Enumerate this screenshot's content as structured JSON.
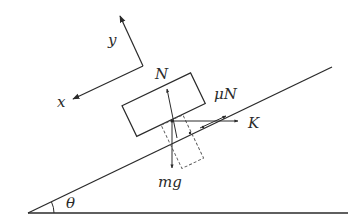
{
  "diagram": {
    "labels": {
      "y_axis": "y",
      "x_axis": "x",
      "normal": "N",
      "friction": "μN",
      "force_k": "K",
      "weight": "mg",
      "angle": "θ"
    },
    "elements": [
      "inclined plane",
      "ground line",
      "block",
      "coordinate axes x-y",
      "normal force N",
      "friction force μN",
      "applied horizontal force K",
      "weight mg with dashed component rectangle",
      "angle θ arc"
    ],
    "colors": {
      "stroke": "#2a2a2a",
      "background": "#ffffff"
    }
  }
}
